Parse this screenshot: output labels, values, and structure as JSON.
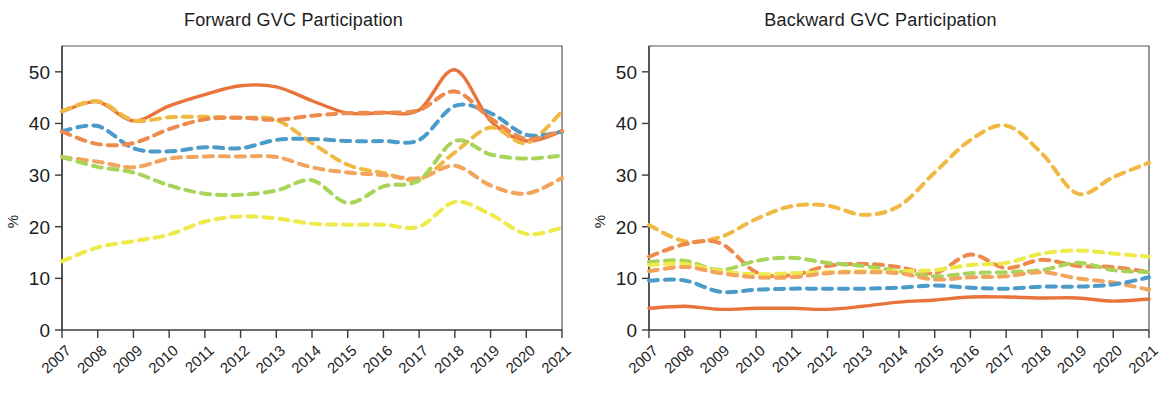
{
  "figure": {
    "ylabel": "%",
    "y_ticks": [
      0,
      10,
      20,
      30,
      40,
      50
    ],
    "x_ticks": [
      "2007",
      "2008",
      "2009",
      "2010",
      "2011",
      "2012",
      "2013",
      "2014",
      "2015",
      "2016",
      "2017",
      "2018",
      "2019",
      "2020",
      "2021"
    ],
    "colors": {
      "orange_solid": "#E8743B",
      "gold": "#F2B844",
      "blue": "#4A9BC9",
      "orange_dark": "#EE8A4C",
      "orange_light": "#F2A35C",
      "green": "#A8D45A",
      "yellow": "#EDEA4A"
    }
  },
  "chart_data": [
    {
      "type": "line",
      "title": "Forward GVC Participation",
      "xlabel": "",
      "ylabel": "%",
      "ylim": [
        0,
        55
      ],
      "y_ticks": [
        0,
        10,
        20,
        30,
        40,
        50
      ],
      "grid": false,
      "legend": "none",
      "x": [
        "2007",
        "2008",
        "2009",
        "2010",
        "2011",
        "2012",
        "2013",
        "2014",
        "2015",
        "2016",
        "2017",
        "2018",
        "2019",
        "2020",
        "2021"
      ],
      "series": [
        {
          "name": "series-orange-solid",
          "color": "#E8743B",
          "style": "solid",
          "values": [
            42.3,
            44.2,
            40.5,
            43.4,
            45.6,
            47.3,
            47.1,
            44.4,
            42.0,
            42.1,
            42.6,
            50.4,
            40.5,
            36.6,
            38.5
          ]
        },
        {
          "name": "series-gold-dashed",
          "color": "#F2B844",
          "style": "dashed",
          "values": [
            42.4,
            44.3,
            40.6,
            41.2,
            41.3,
            41.1,
            40.7,
            36.2,
            32.0,
            30.4,
            29.2,
            34.4,
            39.2,
            36.2,
            42.3
          ]
        },
        {
          "name": "series-blue-dashed",
          "color": "#4A9BC9",
          "style": "dashed",
          "values": [
            38.5,
            39.5,
            35.2,
            34.6,
            35.4,
            35.2,
            36.8,
            37.0,
            36.6,
            36.6,
            36.8,
            43.4,
            42.0,
            37.8,
            38.4
          ]
        },
        {
          "name": "series-orange-dark-dashed",
          "color": "#EE8A4C",
          "style": "dashed",
          "values": [
            38.4,
            36.0,
            36.2,
            38.9,
            40.8,
            41.1,
            40.7,
            41.5,
            42.0,
            42.1,
            42.6,
            46.2,
            41.0,
            37.0,
            38.6
          ]
        },
        {
          "name": "series-orange-light-dashed",
          "color": "#F2A35C",
          "style": "dashed",
          "values": [
            33.5,
            32.6,
            31.5,
            33.2,
            33.6,
            33.6,
            33.5,
            31.5,
            30.5,
            30.0,
            29.4,
            31.8,
            28.0,
            26.4,
            29.4
          ]
        },
        {
          "name": "series-green-dashed",
          "color": "#A8D45A",
          "style": "dashed",
          "values": [
            33.5,
            31.6,
            30.5,
            28.0,
            26.4,
            26.2,
            27.0,
            29.0,
            24.6,
            27.8,
            29.0,
            36.6,
            34.0,
            33.2,
            33.8
          ]
        },
        {
          "name": "series-yellow-dashed",
          "color": "#EDEA4A",
          "style": "dashed",
          "values": [
            13.3,
            16.0,
            17.2,
            18.5,
            21.0,
            22.0,
            21.6,
            20.6,
            20.4,
            20.4,
            20.0,
            24.8,
            22.4,
            18.6,
            19.8
          ]
        }
      ]
    },
    {
      "type": "line",
      "title": "Backward GVC Participation",
      "xlabel": "",
      "ylabel": "%",
      "ylim": [
        0,
        55
      ],
      "y_ticks": [
        0,
        10,
        20,
        30,
        40,
        50
      ],
      "grid": false,
      "legend": "none",
      "x": [
        "2007",
        "2008",
        "2009",
        "2010",
        "2011",
        "2012",
        "2013",
        "2014",
        "2015",
        "2016",
        "2017",
        "2018",
        "2019",
        "2020",
        "2021"
      ],
      "series": [
        {
          "name": "series-gold-dashed",
          "color": "#F2B844",
          "style": "dashed",
          "values": [
            20.3,
            17.2,
            18.0,
            21.5,
            24.0,
            24.1,
            22.3,
            24.0,
            30.5,
            36.8,
            39.6,
            34.2,
            26.4,
            29.6,
            32.4
          ]
        },
        {
          "name": "series-orange-dashed",
          "color": "#EE8A4C",
          "style": "dashed",
          "values": [
            14.2,
            16.6,
            16.8,
            11.2,
            10.6,
            12.4,
            12.8,
            12.2,
            11.0,
            14.6,
            12.0,
            13.6,
            12.4,
            12.2,
            11.2
          ]
        },
        {
          "name": "series-green-dashed",
          "color": "#A8D45A",
          "style": "dashed",
          "values": [
            13.2,
            13.4,
            11.6,
            13.4,
            14.0,
            13.0,
            12.4,
            11.4,
            10.4,
            11.0,
            11.2,
            11.6,
            13.0,
            11.6,
            11.2
          ]
        },
        {
          "name": "series-yellow-dashed",
          "color": "#EDEA4A",
          "style": "dashed",
          "values": [
            12.6,
            12.8,
            11.4,
            10.8,
            11.0,
            11.2,
            11.4,
            11.4,
            11.6,
            12.6,
            13.0,
            14.8,
            15.4,
            14.8,
            14.2
          ]
        },
        {
          "name": "series-orange-light-dashed",
          "color": "#F2A35C",
          "style": "dashed",
          "values": [
            11.4,
            12.2,
            11.0,
            10.2,
            10.2,
            11.0,
            11.2,
            11.0,
            9.8,
            10.2,
            10.4,
            11.2,
            10.0,
            9.2,
            7.8
          ]
        },
        {
          "name": "series-blue-dashed",
          "color": "#4A9BC9",
          "style": "dashed",
          "values": [
            9.6,
            9.6,
            7.4,
            7.8,
            8.0,
            8.0,
            8.0,
            8.2,
            8.6,
            8.2,
            8.0,
            8.4,
            8.4,
            8.8,
            10.2
          ]
        },
        {
          "name": "series-orange-solid",
          "color": "#E8743B",
          "style": "solid",
          "values": [
            4.2,
            4.6,
            4.0,
            4.2,
            4.2,
            4.0,
            4.6,
            5.4,
            5.8,
            6.4,
            6.4,
            6.2,
            6.2,
            5.6,
            6.0
          ]
        }
      ]
    }
  ]
}
